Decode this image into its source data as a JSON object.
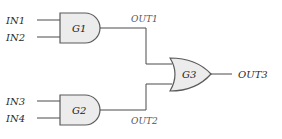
{
  "diagram": {
    "type": "logic-circuit",
    "inputs": [
      {
        "id": "IN1",
        "label": "IN1"
      },
      {
        "id": "IN2",
        "label": "IN2"
      },
      {
        "id": "IN3",
        "label": "IN3"
      },
      {
        "id": "IN4",
        "label": "IN4"
      }
    ],
    "gates": [
      {
        "id": "G1",
        "label": "G1",
        "kind": "AND",
        "inputs": [
          "IN1",
          "IN2"
        ],
        "output": "OUT1"
      },
      {
        "id": "G2",
        "label": "G2",
        "kind": "AND",
        "inputs": [
          "IN3",
          "IN4"
        ],
        "output": "OUT2"
      },
      {
        "id": "G3",
        "label": "G3",
        "kind": "OR",
        "inputs": [
          "OUT1",
          "OUT2"
        ],
        "output": "OUT3"
      }
    ],
    "signals": [
      {
        "id": "OUT1",
        "label": "OUT1"
      },
      {
        "id": "OUT2",
        "label": "OUT2"
      },
      {
        "id": "OUT3",
        "label": "OUT3"
      }
    ],
    "colors": {
      "gate_fill": "#ececec",
      "gate_stroke": "#5a5a5a",
      "wire": "#4a4a4a"
    }
  }
}
